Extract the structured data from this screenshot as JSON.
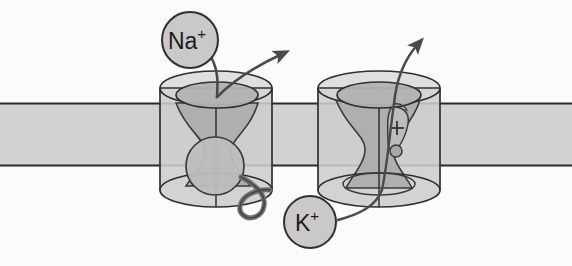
{
  "figure": {
    "background_color": "#fbfbfb",
    "membrane": {
      "name": "lipid-bilayer-membrane",
      "fill_color": "#d2d2d2",
      "edge_color": "#2b2b2b",
      "top_y": 103,
      "bottom_y": 166
    },
    "outline_color": "#2f2f2f",
    "channel_fill": "#cfcfcf",
    "pore_fill": "#b6b6b6"
  },
  "labels": [
    {
      "id": "sodium",
      "name": "na-ion-label",
      "element": "Na",
      "charge": "+",
      "text": "Na+",
      "cx": 190,
      "cy": 40,
      "r": 28,
      "fill": "#c9c9c9",
      "stroke": "#2f2f2f"
    },
    {
      "id": "potassium",
      "name": "k-ion-label",
      "element": "K",
      "charge": "+",
      "text": "K+",
      "cx": 310,
      "cy": 222,
      "r": 26,
      "fill": "#c9c9c9",
      "stroke": "#2f2f2f"
    }
  ],
  "channels": [
    {
      "id": "sodium-channel",
      "name": "sodium-channel",
      "ion": "Na+",
      "center_x": 216,
      "top_y": 88,
      "bottom_y": 190,
      "radius_x": 56,
      "radius_y": 17,
      "has_inactivation_ball": true,
      "has_voltage_sensor": false,
      "ball": {
        "name": "inactivation-ball",
        "cx": 215,
        "cy": 166,
        "r": 29
      },
      "tether": {
        "name": "inactivation-tether-loop"
      }
    },
    {
      "id": "potassium-channel",
      "name": "potassium-channel",
      "ion": "K+",
      "center_x": 379,
      "top_y": 88,
      "bottom_y": 190,
      "radius_x": 61,
      "radius_y": 17,
      "has_inactivation_ball": false,
      "has_voltage_sensor": true,
      "voltage_sensor": {
        "name": "voltage-sensor-paddle",
        "charge": "+",
        "cx": 397,
        "cy": 125
      }
    }
  ],
  "arrows": [
    {
      "id": "na-entry",
      "name": "na-entry-arrow",
      "description": "Na+ label pointing into sodium channel pore",
      "direction": "down-right",
      "has_head": false
    },
    {
      "id": "na-exit",
      "name": "na-exit-arrow",
      "description": "Ion flux exiting sodium channel upward",
      "direction": "up-right",
      "has_head": true
    },
    {
      "id": "k-entry",
      "name": "k-entry-arrow",
      "description": "K+ label pointing into potassium channel",
      "direction": "up-right",
      "has_head": false
    },
    {
      "id": "k-exit",
      "name": "k-exit-arrow",
      "description": "Ion flux exiting potassium channel upward",
      "direction": "up-right",
      "has_head": true
    }
  ]
}
